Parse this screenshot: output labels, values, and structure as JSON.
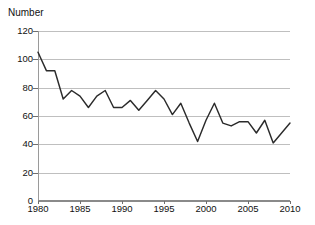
{
  "chart_data": {
    "type": "line",
    "title": "",
    "ylabel": "Number",
    "xlabel": "",
    "xlim": [
      1980,
      2010
    ],
    "ylim": [
      0,
      120
    ],
    "grid": true,
    "legend": "none",
    "y_ticks": [
      0,
      20,
      40,
      60,
      80,
      100,
      120
    ],
    "y_tick_labels": [
      "0",
      "20",
      "40",
      "60",
      "80",
      "100",
      "120"
    ],
    "x_ticks": [
      1980,
      1985,
      1990,
      1995,
      2000,
      2005,
      2010
    ],
    "x_tick_labels": [
      "1980",
      "1985",
      "1990",
      "1995",
      "2000",
      "2005",
      "2010"
    ],
    "line_color": "#2b2b2b",
    "grid_color": "#bfbfbf",
    "axis_color": "#8a8a8a",
    "x": [
      1980,
      1981,
      1982,
      1983,
      1984,
      1985,
      1986,
      1987,
      1988,
      1989,
      1990,
      1991,
      1992,
      1993,
      1994,
      1995,
      1996,
      1997,
      1998,
      1999,
      2000,
      2001,
      2002,
      2003,
      2004,
      2005,
      2006,
      2007,
      2008,
      2009,
      2010
    ],
    "values": [
      105,
      92,
      92,
      72,
      78,
      74,
      66,
      74,
      78,
      66,
      66,
      71,
      64,
      71,
      78,
      72,
      61,
      69,
      55,
      42,
      57,
      69,
      55,
      53,
      56,
      56,
      48,
      57,
      41,
      48,
      55
    ],
    "series": [
      {
        "name": "Number",
        "values": [
          105,
          92,
          92,
          72,
          78,
          74,
          66,
          74,
          78,
          66,
          66,
          71,
          64,
          71,
          78,
          72,
          61,
          69,
          55,
          42,
          57,
          69,
          55,
          53,
          56,
          56,
          48,
          57,
          41,
          48,
          55
        ]
      }
    ]
  }
}
